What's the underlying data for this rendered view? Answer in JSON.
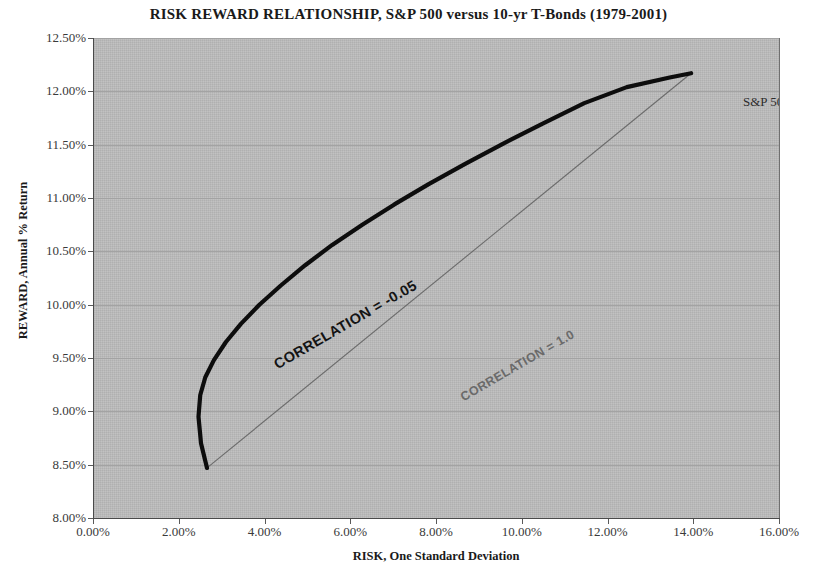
{
  "chart_data": {
    "type": "line",
    "title": "RISK REWARD RELATIONSHIP,  S&P 500 versus 10-yr T-Bonds (1979-2001)",
    "xlabel": "RISK, One Standard Deviation",
    "ylabel": "REWARD, Annual % Return",
    "xlim": [
      0.0,
      16.0
    ],
    "ylim": [
      8.0,
      12.5
    ],
    "x_ticks": [
      "0.00%",
      "2.00%",
      "4.00%",
      "6.00%",
      "8.00%",
      "10.00%",
      "12.00%",
      "14.00%",
      "16.00%"
    ],
    "x_tick_values": [
      0.0,
      2.0,
      4.0,
      6.0,
      8.0,
      10.0,
      12.0,
      14.0,
      16.0
    ],
    "y_ticks": [
      "8.00%",
      "8.50%",
      "9.00%",
      "9.50%",
      "10.00%",
      "10.50%",
      "11.00%",
      "11.50%",
      "12.00%",
      "12.50%"
    ],
    "y_tick_values": [
      8.0,
      8.5,
      9.0,
      9.5,
      10.0,
      10.5,
      11.0,
      11.5,
      12.0,
      12.5
    ],
    "grid": "horizontal",
    "legend": "none",
    "plot_background": "#bcbcbc",
    "series": [
      {
        "name": "CORRELATION = -0.05",
        "style": "thick-black-curve",
        "color": "#0d0d0d",
        "width": 4,
        "points": [
          [
            2.66,
            8.47
          ],
          [
            2.52,
            8.7
          ],
          [
            2.46,
            8.95
          ],
          [
            2.5,
            9.15
          ],
          [
            2.62,
            9.32
          ],
          [
            2.82,
            9.48
          ],
          [
            3.1,
            9.65
          ],
          [
            3.45,
            9.82
          ],
          [
            3.88,
            10.0
          ],
          [
            4.38,
            10.18
          ],
          [
            4.95,
            10.37
          ],
          [
            5.58,
            10.56
          ],
          [
            6.28,
            10.75
          ],
          [
            7.03,
            10.94
          ],
          [
            7.83,
            11.13
          ],
          [
            8.68,
            11.32
          ],
          [
            9.57,
            11.51
          ],
          [
            10.5,
            11.7
          ],
          [
            11.46,
            11.89
          ],
          [
            12.45,
            12.04
          ],
          [
            13.45,
            12.13
          ],
          [
            13.95,
            12.17
          ]
        ]
      },
      {
        "name": "CORRELATION = 1.0",
        "style": "thin-grey-line",
        "color": "#6b6b6b",
        "width": 1,
        "points": [
          [
            2.66,
            8.47
          ],
          [
            13.95,
            12.17
          ]
        ]
      }
    ],
    "annotations": [
      {
        "id": "corr-neg",
        "text": "CORRELATION = -0.05",
        "rotation": -30,
        "color": "#141414",
        "weight": "bold"
      },
      {
        "id": "corr-one",
        "text": "CORRELATION = 1.0",
        "rotation": -30,
        "color": "#6a6a6a",
        "weight": "bold"
      },
      {
        "id": "sp500",
        "text": "S&P 500",
        "at": [
          13.95,
          12.17
        ],
        "color": "#2c2c2c"
      },
      {
        "id": "treasury",
        "text": "10-year Treasury",
        "at": [
          2.66,
          8.47
        ],
        "color": "#2c2c2c"
      }
    ]
  }
}
